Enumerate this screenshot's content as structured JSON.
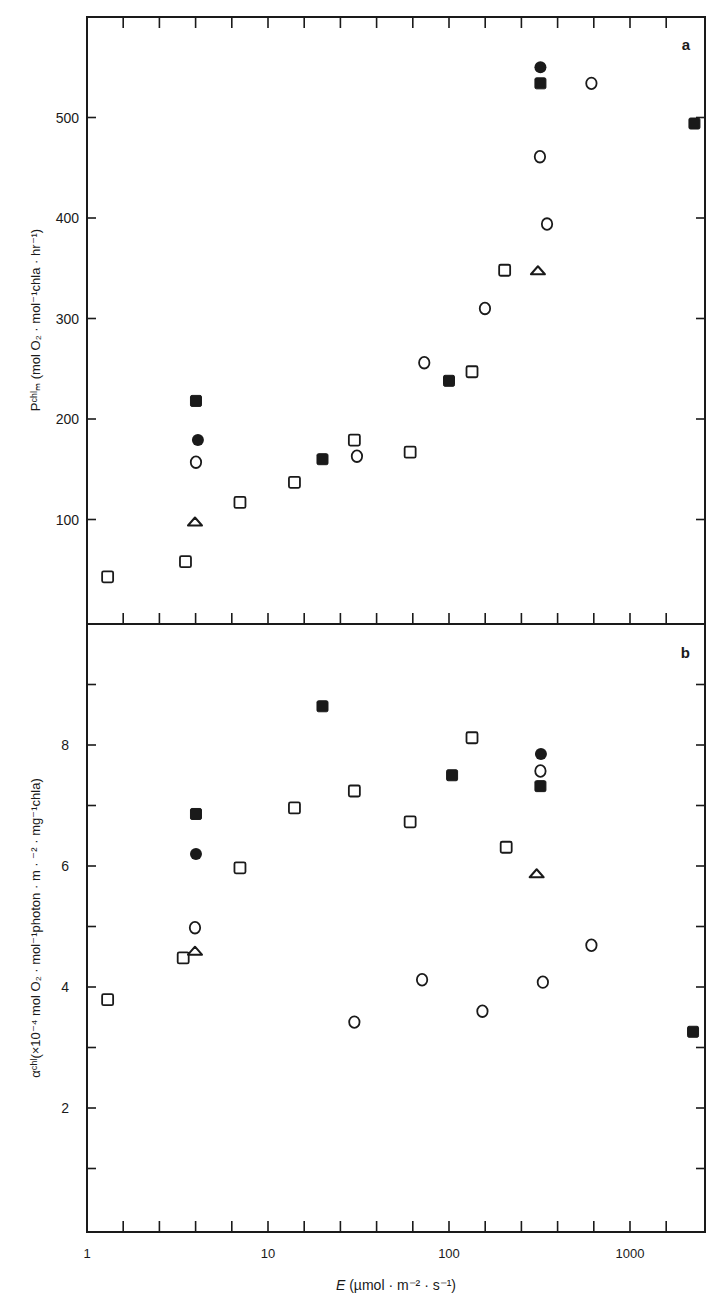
{
  "figure": {
    "panel_a_label": "a",
    "panel_b_label": "b",
    "x_axis_label_italic": "E",
    "x_axis_label_rest": " (µmol · m⁻² · s⁻¹)",
    "panel_a_ylabel": "Pᶜʰˡₘ (mol O₂ · mol⁻¹chla · hr⁻¹)",
    "panel_b_ylabel": "αᶜʰˡ(×10⁻⁴ mol O₂ · mol⁻¹photon · m · ⁻² · mg⁻¹chla)",
    "ink_color": "#1a1a1a",
    "background_color": "#ffffff"
  },
  "chart_data": [
    {
      "type": "scatter",
      "panel": "a",
      "title": "",
      "xlabel": "E (µmol · m⁻² · s⁻¹)",
      "ylabel": "P^chl_m (mol O2 · mol⁻¹chla · hr⁻¹)",
      "xscale": "log",
      "xlim": [
        1,
        2800
      ],
      "ylim": [
        0,
        580
      ],
      "xticks": [
        1,
        10,
        100,
        1000
      ],
      "xtick_labels": [
        "1",
        "10",
        "100",
        "1000"
      ],
      "yticks": [
        100,
        200,
        300,
        400,
        500
      ],
      "ytick_labels": [
        "100",
        "200",
        "300",
        "400",
        "500"
      ],
      "grid": false,
      "legend": null,
      "series": [
        {
          "name": "open square",
          "marker": "open-square",
          "points": [
            [
              1.3,
              43
            ],
            [
              3.5,
              58
            ],
            [
              7.0,
              117
            ],
            [
              14,
              137
            ],
            [
              30,
              179
            ],
            [
              61,
              167
            ],
            [
              134,
              247
            ],
            [
              203,
              348
            ]
          ]
        },
        {
          "name": "filled square",
          "marker": "filled-square",
          "points": [
            [
              4.0,
              218
            ],
            [
              20,
              160
            ],
            [
              100,
              238
            ],
            [
              320,
              534
            ],
            [
              2270,
              494
            ]
          ]
        },
        {
          "name": "open circle",
          "marker": "open-circle",
          "points": [
            [
              4.0,
              157
            ],
            [
              31,
              163
            ],
            [
              73,
              256
            ],
            [
              158,
              310
            ],
            [
              318,
              461
            ],
            [
              348,
              394
            ],
            [
              612,
              534
            ]
          ]
        },
        {
          "name": "filled circle",
          "marker": "filled-circle",
          "points": [
            [
              4.1,
              179
            ],
            [
              320,
              550
            ]
          ]
        },
        {
          "name": "open triangle",
          "marker": "open-triangle",
          "points": [
            [
              3.95,
              98
            ],
            [
              310,
              348
            ]
          ]
        }
      ]
    },
    {
      "type": "scatter",
      "panel": "b",
      "title": "",
      "xlabel": "E (µmol · m⁻² · s⁻¹)",
      "ylabel": "α^chl (×10⁻⁴ mol O2 · mol⁻¹photon · m⁻² · mg⁻¹chla)",
      "xscale": "log",
      "xlim": [
        1,
        2800
      ],
      "ylim": [
        0,
        10
      ],
      "xticks": [
        1,
        10,
        100,
        1000
      ],
      "xtick_labels": [
        "1",
        "10",
        "100",
        "1000"
      ],
      "yticks": [
        1,
        2,
        3,
        4,
        5,
        6,
        7,
        8,
        9
      ],
      "ytick_labels": [
        "",
        "2",
        "",
        "4",
        "",
        "6",
        "",
        "8",
        ""
      ],
      "grid": false,
      "legend": null,
      "series": [
        {
          "name": "open square",
          "marker": "open-square",
          "points": [
            [
              1.3,
              3.79
            ],
            [
              3.4,
              4.48
            ],
            [
              7.0,
              5.97
            ],
            [
              14,
              6.96
            ],
            [
              30,
              7.24
            ],
            [
              61,
              6.73
            ],
            [
              134,
              8.12
            ],
            [
              207,
              6.31
            ]
          ]
        },
        {
          "name": "filled square",
          "marker": "filled-square",
          "points": [
            [
              4.0,
              6.86
            ],
            [
              20,
              8.64
            ],
            [
              104,
              7.5
            ],
            [
              320,
              7.32
            ],
            [
              2230,
              3.26
            ]
          ]
        },
        {
          "name": "open circle",
          "marker": "open-circle",
          "points": [
            [
              3.95,
              4.98
            ],
            [
              30,
              3.42
            ],
            [
              71,
              4.12
            ],
            [
              153,
              3.6
            ],
            [
              320,
              7.57
            ],
            [
              330,
              4.08
            ],
            [
              612,
              4.69
            ]
          ]
        },
        {
          "name": "filled circle",
          "marker": "filled-circle",
          "points": [
            [
              4.0,
              6.2
            ],
            [
              322,
              7.85
            ]
          ]
        },
        {
          "name": "open triangle",
          "marker": "open-triangle",
          "points": [
            [
              3.95,
              4.6
            ],
            [
              305,
              5.88
            ]
          ]
        }
      ]
    }
  ]
}
